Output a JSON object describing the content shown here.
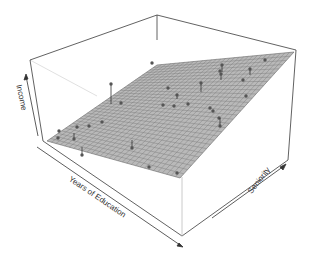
{
  "chart_data": {
    "type": "scatter3d-with-regression-plane",
    "title": "",
    "xlabel": "Years of Education",
    "ylabel": "Seniority",
    "zlabel": "Income",
    "grid": false,
    "legend": null,
    "surface": {
      "kind": "least-squares regression plane",
      "fill_color": "#b8b8b8",
      "grid_line_color": "#6e6e6e",
      "grid_divisions": 30,
      "trend": "Income increases with both Years of Education and Seniority"
    },
    "points": {
      "count": 30,
      "marker_color": "#555555",
      "residual_segments": true,
      "screen_positions": [
        {
          "x": 111,
          "y": 84,
          "plane_y": 104
        },
        {
          "x": 121,
          "y": 103,
          "plane_y": 103
        },
        {
          "x": 152,
          "y": 63,
          "plane_y": 63
        },
        {
          "x": 222,
          "y": 65,
          "plane_y": 72
        },
        {
          "x": 265,
          "y": 60,
          "plane_y": 60
        },
        {
          "x": 220,
          "y": 71,
          "plane_y": 71
        },
        {
          "x": 221,
          "y": 74,
          "plane_y": 80
        },
        {
          "x": 250,
          "y": 69,
          "plane_y": 75
        },
        {
          "x": 243,
          "y": 80,
          "plane_y": 80
        },
        {
          "x": 168,
          "y": 88,
          "plane_y": 88
        },
        {
          "x": 201,
          "y": 83,
          "plane_y": 92
        },
        {
          "x": 177,
          "y": 95,
          "plane_y": 99
        },
        {
          "x": 163,
          "y": 105,
          "plane_y": 105
        },
        {
          "x": 174,
          "y": 106,
          "plane_y": 106
        },
        {
          "x": 188,
          "y": 104,
          "plane_y": 104
        },
        {
          "x": 210,
          "y": 108,
          "plane_y": 108
        },
        {
          "x": 246,
          "y": 96,
          "plane_y": 96
        },
        {
          "x": 213,
          "y": 111,
          "plane_y": 111
        },
        {
          "x": 219,
          "y": 118,
          "plane_y": 118
        },
        {
          "x": 220,
          "y": 126,
          "plane_y": 118
        },
        {
          "x": 89,
          "y": 126,
          "plane_y": 126
        },
        {
          "x": 77,
          "y": 127,
          "plane_y": 127
        },
        {
          "x": 102,
          "y": 122,
          "plane_y": 122
        },
        {
          "x": 59,
          "y": 131,
          "plane_y": 131
        },
        {
          "x": 74,
          "y": 139,
          "plane_y": 133
        },
        {
          "x": 58,
          "y": 138,
          "plane_y": 138
        },
        {
          "x": 82,
          "y": 155,
          "plane_y": 147
        },
        {
          "x": 132,
          "y": 148,
          "plane_y": 140
        },
        {
          "x": 149,
          "y": 167,
          "plane_y": 167
        },
        {
          "x": 177,
          "y": 173,
          "plane_y": 173
        }
      ]
    },
    "box": {
      "line_color": "#444444",
      "hidden_edge_color": "#cfcfcf"
    }
  }
}
